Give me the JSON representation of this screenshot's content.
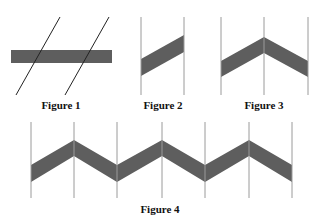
{
  "colors": {
    "band": "#5e5e5e",
    "oblique_line": "#222222",
    "vertical_line": "#9a9a9a",
    "label": "#111111",
    "background": "#ffffff"
  },
  "figures": [
    {
      "id": 1,
      "label": "Figure 1",
      "label_pos": [
        61,
        99
      ],
      "description": "Horizontal gray bar crossed by two parallel oblique lines",
      "bar": {
        "x": 11,
        "y": 50,
        "w": 101,
        "h": 13
      },
      "lines": [
        {
          "x1": 60,
          "y1": 17,
          "x2": 16,
          "y2": 95
        },
        {
          "x1": 109,
          "y1": 17,
          "x2": 65,
          "y2": 95
        }
      ]
    },
    {
      "id": 2,
      "label": "Figure 2",
      "label_pos": [
        163,
        99
      ],
      "description": "Sloped band between two vertical lines",
      "verticals": [
        141,
        184
      ],
      "v_range": [
        17,
        95
      ],
      "band": [
        [
          141,
          59
        ],
        [
          184,
          35
        ],
        [
          184,
          52
        ],
        [
          141,
          76
        ]
      ]
    },
    {
      "id": 3,
      "label": "Figure 3",
      "label_pos": [
        264,
        99
      ],
      "description": "Chevron band peaking at middle vertical line",
      "verticals": [
        221,
        264,
        308
      ],
      "v_range": [
        17,
        95
      ],
      "band": [
        [
          221,
          61
        ],
        [
          264,
          37
        ],
        [
          308,
          61
        ],
        [
          308,
          77
        ],
        [
          264,
          53
        ],
        [
          221,
          77
        ]
      ]
    },
    {
      "id": 4,
      "label": "Figure 4",
      "label_pos": [
        160,
        203
      ],
      "description": "Zigzag band across six vertical lines",
      "verticals": [
        31,
        74,
        117,
        162,
        205,
        249,
        292
      ],
      "v_range": [
        122,
        198
      ],
      "band": [
        [
          31,
          165
        ],
        [
          74,
          140
        ],
        [
          117,
          165
        ],
        [
          162,
          140
        ],
        [
          205,
          165
        ],
        [
          249,
          140
        ],
        [
          292,
          165
        ],
        [
          292,
          182
        ],
        [
          249,
          156
        ],
        [
          205,
          182
        ],
        [
          162,
          156
        ],
        [
          117,
          182
        ],
        [
          74,
          156
        ],
        [
          31,
          182
        ]
      ]
    }
  ]
}
